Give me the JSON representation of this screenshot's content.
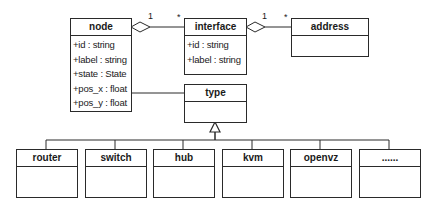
{
  "diagram": {
    "type": "UML class diagram",
    "classes": {
      "node": {
        "name": "node",
        "attributes": [
          "+id : string",
          "+label : string",
          "+state : State",
          "+pos_x : float",
          "+pos_y : float"
        ]
      },
      "interface": {
        "name": "interface",
        "attributes": [
          "+id : string",
          "+label : string"
        ]
      },
      "address": {
        "name": "address",
        "attributes": []
      },
      "type": {
        "name": "type",
        "attributes": []
      },
      "subtypes": [
        {
          "name": "router"
        },
        {
          "name": "switch"
        },
        {
          "name": "hub"
        },
        {
          "name": "kvm"
        },
        {
          "name": "openvz"
        },
        {
          "name": "......"
        }
      ]
    },
    "relations": [
      {
        "kind": "aggregation",
        "whole": "node",
        "part": "interface",
        "whole_mult": "1",
        "part_mult": "*"
      },
      {
        "kind": "aggregation",
        "whole": "interface",
        "part": "address",
        "whole_mult": "1",
        "part_mult": "*"
      },
      {
        "kind": "association",
        "from": "node",
        "to": "type"
      },
      {
        "kind": "generalization",
        "parent": "type",
        "children": [
          "router",
          "switch",
          "hub",
          "kvm",
          "openvz",
          "......"
        ]
      }
    ],
    "multiplicities": {
      "node_interface_whole": "1",
      "node_interface_part": "*",
      "interface_address_whole": "1",
      "interface_address_part": "*"
    }
  }
}
